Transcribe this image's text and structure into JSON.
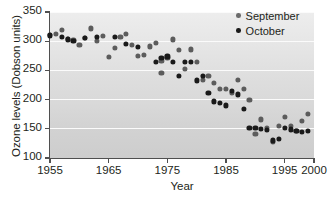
{
  "chart_data": {
    "type": "scatter",
    "title": "",
    "xlabel": "Year",
    "ylabel": "Ozone levels (Dobson units)",
    "xlim": [
      1955,
      2000
    ],
    "ylim": [
      100,
      350
    ],
    "xticks": [
      1955,
      1965,
      1975,
      1985,
      1995,
      2000
    ],
    "yticks": [
      100,
      150,
      200,
      250,
      300,
      350
    ],
    "grid": "horizontal",
    "legend_position": "top-right",
    "series": [
      {
        "name": "September",
        "color": "#5c5c5c",
        "points": [
          [
            1955,
            311
          ],
          [
            1956,
            313
          ],
          [
            1957,
            320
          ],
          [
            1958,
            304
          ],
          [
            1959,
            302
          ],
          [
            1960,
            293
          ],
          [
            1961,
            306
          ],
          [
            1962,
            322
          ],
          [
            1963,
            301
          ],
          [
            1964,
            309
          ],
          [
            1965,
            273
          ],
          [
            1966,
            289
          ],
          [
            1967,
            307
          ],
          [
            1968,
            313
          ],
          [
            1969,
            294
          ],
          [
            1970,
            275
          ],
          [
            1971,
            276
          ],
          [
            1972,
            291
          ],
          [
            1973,
            297
          ],
          [
            1974,
            266
          ],
          [
            1974,
            246
          ],
          [
            1975,
            272
          ],
          [
            1976,
            303
          ],
          [
            1977,
            285
          ],
          [
            1978,
            252
          ],
          [
            1979,
            286
          ],
          [
            1980,
            265
          ],
          [
            1981,
            234
          ],
          [
            1982,
            240
          ],
          [
            1983,
            228
          ],
          [
            1984,
            219
          ],
          [
            1985,
            218
          ],
          [
            1986,
            212
          ],
          [
            1987,
            234
          ],
          [
            1988,
            218
          ],
          [
            1989,
            199
          ],
          [
            1990,
            141
          ],
          [
            1991,
            166
          ],
          [
            1992,
            151
          ],
          [
            1993,
            127
          ],
          [
            1994,
            155
          ],
          [
            1995,
            170
          ],
          [
            1996,
            155
          ],
          [
            1997,
            147
          ],
          [
            1998,
            163
          ],
          [
            1999,
            175
          ]
        ]
      },
      {
        "name": "October",
        "color": "#1a1a1a",
        "points": [
          [
            1955,
            310
          ],
          [
            1957,
            307
          ],
          [
            1958,
            303
          ],
          [
            1959,
            301
          ],
          [
            1961,
            305
          ],
          [
            1963,
            308
          ],
          [
            1966,
            307
          ],
          [
            1968,
            295
          ],
          [
            1970,
            290
          ],
          [
            1973,
            264
          ],
          [
            1974,
            272
          ],
          [
            1975,
            274
          ],
          [
            1976,
            265
          ],
          [
            1977,
            240
          ],
          [
            1978,
            265
          ],
          [
            1979,
            264
          ],
          [
            1980,
            233
          ],
          [
            1981,
            241
          ],
          [
            1982,
            211
          ],
          [
            1983,
            197
          ],
          [
            1984,
            195
          ],
          [
            1985,
            190
          ],
          [
            1986,
            215
          ],
          [
            1987,
            209
          ],
          [
            1988,
            184
          ],
          [
            1989,
            152
          ],
          [
            1990,
            152
          ],
          [
            1991,
            150
          ],
          [
            1992,
            148
          ],
          [
            1993,
            130
          ],
          [
            1994,
            133
          ],
          [
            1995,
            152
          ],
          [
            1996,
            149
          ],
          [
            1997,
            146
          ],
          [
            1998,
            145
          ],
          [
            1999,
            146
          ]
        ]
      }
    ]
  },
  "legend": {
    "items": [
      {
        "label": "September",
        "marker": "dot-marker-gray"
      },
      {
        "label": "October",
        "marker": "dot-marker-black"
      }
    ]
  }
}
